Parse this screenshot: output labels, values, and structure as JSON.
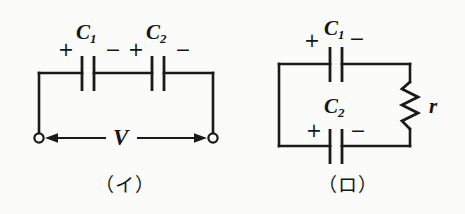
{
  "figure": {
    "background_color": "#fbfbf9",
    "ink_color": "#1a1a1a",
    "panels": [
      {
        "id": "panel-i",
        "caption": "（イ）",
        "description": "Two capacitors in series across an open-terminal voltage V",
        "labels": {
          "cap1": "C",
          "cap1_sub": "1",
          "cap2": "C",
          "cap2_sub": "2",
          "voltage": "V",
          "cap1_plus": "+",
          "cap1_minus": "−",
          "cap2_plus": "+",
          "cap2_minus": "−"
        }
      },
      {
        "id": "panel-ro",
        "caption": "（ロ）",
        "description": "Two capacitors on parallel branches with a resistor r",
        "labels": {
          "cap1": "C",
          "cap1_sub": "1",
          "cap2": "C",
          "cap2_sub": "2",
          "resistor": "r",
          "cap1_plus": "+",
          "cap1_minus": "−",
          "cap2_plus": "+",
          "cap2_minus": "−"
        }
      }
    ]
  }
}
